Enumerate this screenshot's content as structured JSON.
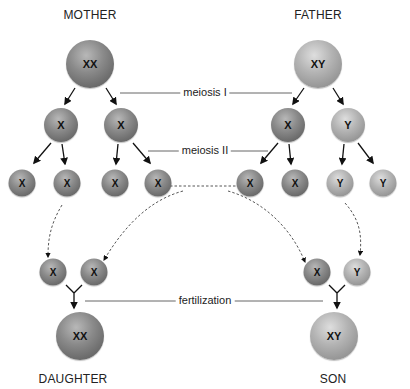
{
  "diagram": {
    "title_left": "MOTHER",
    "title_right": "FATHER",
    "stages": {
      "meiosis1": "meiosis I",
      "meiosis2": "meiosis II",
      "fertilization": "fertilization"
    },
    "offspring": {
      "daughter_label": "DAUGHTER",
      "son_label": "SON"
    },
    "cells": {
      "mother": "XX",
      "father": "XY",
      "mother_m1": [
        "X",
        "X"
      ],
      "father_m1": [
        "X",
        "Y"
      ],
      "mother_m2": [
        "X",
        "X",
        "X",
        "X"
      ],
      "father_m2": [
        "X",
        "X",
        "Y",
        "Y"
      ],
      "daughter_gametes": [
        "X",
        "X"
      ],
      "son_gametes": [
        "X",
        "Y"
      ],
      "daughter": "XX",
      "son": "XY"
    },
    "colors": {
      "sphere_dark": "#7a7a7a",
      "sphere_light": "#a8a8a8",
      "line": "#555555",
      "text": "#222222"
    }
  }
}
